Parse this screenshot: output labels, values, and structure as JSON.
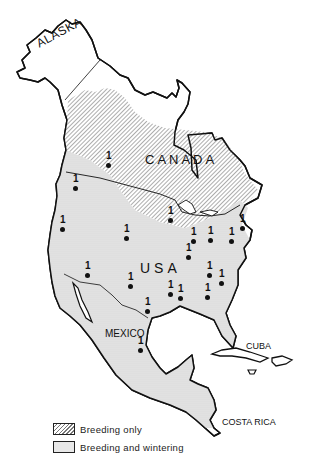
{
  "map": {
    "labels": {
      "alaska": "ALASKA",
      "canada": "CANADA",
      "usa": "USA",
      "mexico": "MEXICO",
      "cuba": "CUBA",
      "costa_rica": "COSTA RICA"
    },
    "points": [
      {
        "label": "1",
        "x": 108,
        "y": 165
      },
      {
        "label": "1",
        "x": 75,
        "y": 188
      },
      {
        "label": "1",
        "x": 62,
        "y": 229
      },
      {
        "label": "1",
        "x": 126,
        "y": 238
      },
      {
        "label": "1",
        "x": 87,
        "y": 275
      },
      {
        "label": "1",
        "x": 130,
        "y": 286
      },
      {
        "label": "1",
        "x": 147,
        "y": 311
      },
      {
        "label": "1",
        "x": 170,
        "y": 220
      },
      {
        "label": "1",
        "x": 193,
        "y": 241
      },
      {
        "label": "1",
        "x": 210,
        "y": 240
      },
      {
        "label": "1",
        "x": 231,
        "y": 241
      },
      {
        "label": "1",
        "x": 242,
        "y": 228
      },
      {
        "label": "1",
        "x": 188,
        "y": 257
      },
      {
        "label": "1",
        "x": 209,
        "y": 275
      },
      {
        "label": "1",
        "x": 221,
        "y": 283
      },
      {
        "label": "1",
        "x": 170,
        "y": 294
      },
      {
        "label": "1",
        "x": 180,
        "y": 298
      },
      {
        "label": "1",
        "x": 207,
        "y": 297
      },
      {
        "label": "1",
        "x": 140,
        "y": 350
      }
    ]
  },
  "legend": {
    "items": [
      {
        "pattern": "hatched",
        "label": "Breeding only"
      },
      {
        "pattern": "stippled",
        "label": "Breeding and wintering"
      }
    ]
  },
  "colors": {
    "outline": "#111111",
    "hatch": "#777777",
    "stipple_bg": "#e6e6e6",
    "background": "#ffffff"
  }
}
